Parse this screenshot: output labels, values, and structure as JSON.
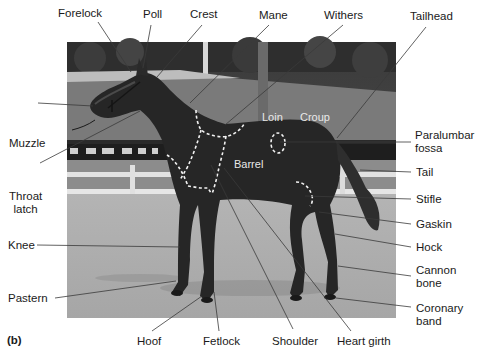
{
  "figure": {
    "panel_label": "(b)",
    "colors": {
      "background": "#ffffff",
      "label_text": "#1a1a1a",
      "leader_line": "#3a3a3a",
      "in_photo_text": "#e8e8e8",
      "dashed_outline": "#f2f2f2"
    }
  },
  "labels": {
    "forelock": "Forelock",
    "poll": "Poll",
    "crest": "Crest",
    "mane": "Mane",
    "withers": "Withers",
    "tailhead": "Tailhead",
    "muzzle": "Muzzle",
    "throat_latch": "Throat\nlatch",
    "knee": "Knee",
    "pastern": "Pastern",
    "hoof": "Hoof",
    "fetlock": "Fetlock",
    "shoulder": "Shoulder",
    "heart_girth": "Heart girth",
    "paralumbar_fossa": "Paralumbar\nfossa",
    "tail": "Tail",
    "stifle": "Stifle",
    "gaskin": "Gaskin",
    "hock": "Hock",
    "cannon_bone": "Cannon\nbone",
    "coronary_band": "Coronary\nband"
  },
  "in_photo_labels": {
    "loin": "Loin",
    "croup": "Croup",
    "barrel": "Barrel"
  }
}
